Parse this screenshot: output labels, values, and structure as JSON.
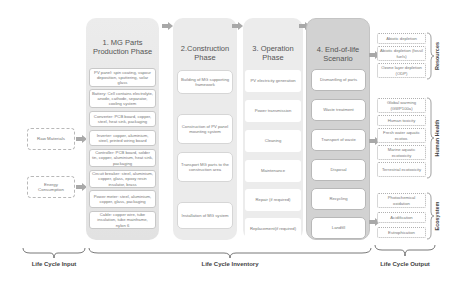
{
  "inputs": {
    "raw_materials": "Raw Materials",
    "energy_consumption": "Energy Consumption"
  },
  "phases": [
    {
      "title_line1": "1. MG Parts",
      "title_line2": "Production Phase",
      "items": [
        "PV panel: spin coating, vapour deposition, sputtering, solar glass",
        "Battery: Cell contains electrolyte, anode, cathode, separator, cooling system",
        "Converter: PCB board, copper, steel, heat sink, packaging",
        "Inverter: copper, aluminium, steel, printed wiring board",
        "Controller: PCB board, solder tin, copper, aluminium, heat sink, packaging",
        "Circuit breaker: steel, aluminium, copper, glass, epoxy resin insulator, brass",
        "Power meter: steel, aluminium, copper, glass, packaging",
        "Cable: copper wire, tube insulation, tube mainframe, nylon 6"
      ]
    },
    {
      "title_line1": "2.Construction",
      "title_line2": "Phase",
      "items": [
        "Building of MG supporting framework",
        "Construction of PV panel mounting system",
        "Transport MG parts to the construction area",
        "Installation of MG system"
      ]
    },
    {
      "title_line1": "3. Operation",
      "title_line2": "Phase",
      "items": [
        "PV electricity generation",
        "Power transmission",
        "Cleaning",
        "Maintenance",
        "Repair (if required)",
        "Replacement(if required)"
      ]
    },
    {
      "title_line1": "4. End-of-life",
      "title_line2": "Scenario",
      "items": [
        "Dismantling of parts",
        "Waste treatment",
        "Transport of waste",
        "Disposal",
        "Recycling",
        "Landfill"
      ]
    }
  ],
  "outputs": {
    "groups": [
      {
        "label": "Resources",
        "items": [
          "Abiotic depletion",
          "Abiotic depletion (fossil fuels)",
          "Ozone layer depletion (ODP)"
        ]
      },
      {
        "label": "Human Health",
        "items": [
          "Global warming (GWP100a)",
          "Human toxicity",
          "Fresh water aquatic ecotox.",
          "Marine aquatic ecotoxicity",
          "Terrestrial ecotoxicity"
        ]
      },
      {
        "label": "Ecosystem",
        "items": [
          "Photochemical oxidation",
          "Acidification",
          "Eutrophication"
        ]
      }
    ]
  },
  "bottom_labels": {
    "input": "Life Cycle Input",
    "inventory": "Life Cycle Inventory",
    "output": "Life Cycle Output"
  },
  "colors": {
    "phase_bg": "#e6e6e6",
    "phase4_bg": "#d2d2d2",
    "arrow": "#a8a8a8",
    "box_border": "#c8c8c8",
    "text": "#555555"
  }
}
